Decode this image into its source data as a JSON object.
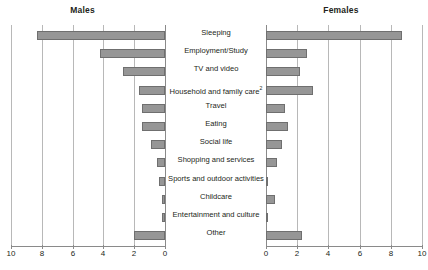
{
  "panels": {
    "left": {
      "title": "Males"
    },
    "right": {
      "title": "Females"
    }
  },
  "axis": {
    "left_ticks": [
      "10",
      "8",
      "6",
      "4",
      "2",
      "0"
    ],
    "right_ticks": [
      "0",
      "2",
      "4",
      "6",
      "8",
      "10"
    ]
  },
  "categories": [
    "Sleeping",
    "Employment/Study",
    "TV and video",
    "Household and family care",
    "Travel",
    "Eating",
    "Social life",
    "Shopping and services",
    "Sports and outdoor activities",
    "Childcare",
    "Entertainment and culture",
    "Other"
  ],
  "category_superscripts": [
    "",
    "",
    "",
    "2",
    "",
    "",
    "",
    "",
    "",
    "",
    "",
    ""
  ],
  "colors": {
    "bar_fill": "#969696",
    "bar_stroke": "#6f6f6f",
    "gridline": "#b8b8b8",
    "axis": "#8a8a8a",
    "text": "#231f20"
  },
  "chart_data": {
    "type": "bar",
    "title": "",
    "subtitle": "",
    "xlabel": "",
    "ylabel": "",
    "orientation": "horizontal",
    "layout": "back-to-back population pyramid",
    "grid": true,
    "legend_position": "none",
    "categories": [
      "Sleeping",
      "Employment/Study",
      "TV and video",
      "Household and family care",
      "Travel",
      "Eating",
      "Social life",
      "Shopping and services",
      "Sports and outdoor activities",
      "Childcare",
      "Entertainment and culture",
      "Other"
    ],
    "series": [
      {
        "name": "Males",
        "side": "left",
        "axis_reversed": true,
        "xlim": [
          0,
          10
        ],
        "tick_values": [
          10,
          8,
          6,
          4,
          2,
          0
        ],
        "values": [
          8.3,
          4.2,
          2.7,
          1.7,
          1.5,
          1.5,
          0.9,
          0.5,
          0.4,
          0.2,
          0.2,
          2.0
        ]
      },
      {
        "name": "Females",
        "side": "right",
        "axis_reversed": false,
        "xlim": [
          0,
          10
        ],
        "tick_values": [
          0,
          2,
          4,
          6,
          8,
          10
        ],
        "values": [
          8.7,
          2.6,
          2.2,
          3.0,
          1.2,
          1.4,
          1.0,
          0.7,
          0.15,
          0.6,
          0.15,
          2.3
        ]
      }
    ],
    "annotations": [
      "2"
    ]
  }
}
